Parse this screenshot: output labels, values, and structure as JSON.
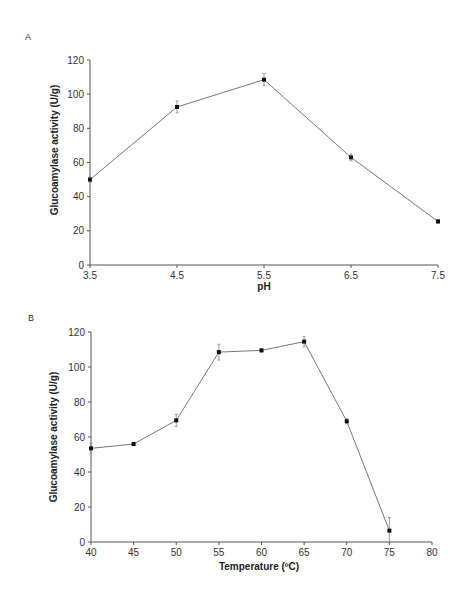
{
  "chart_data": [
    {
      "panel": "A",
      "type": "line",
      "title": "",
      "xlabel": "pH",
      "ylabel": "Glucoamylase activity (U/g)",
      "x": [
        3.5,
        4.5,
        5.5,
        6.5,
        7.5
      ],
      "x_tick_labels": [
        "3.5",
        "4.5",
        "5.5",
        "6.5",
        "7.5"
      ],
      "y_tick_labels": [
        "0",
        "20",
        "40",
        "60",
        "80",
        "100",
        "120"
      ],
      "xlim": [
        3.5,
        7.5
      ],
      "ylim": [
        0,
        120
      ],
      "grid": false,
      "legend": null,
      "series": [
        {
          "name": "Glucoamylase activity",
          "values": [
            50,
            92.5,
            108.5,
            63,
            25.5
          ],
          "error": [
            1.5,
            3.5,
            3.5,
            2,
            1
          ]
        }
      ]
    },
    {
      "panel": "B",
      "type": "line",
      "title": "",
      "xlabel": "Temperature (ºC)",
      "ylabel": "Glucoamylase activity (U/g)",
      "x": [
        40,
        45,
        50,
        55,
        60,
        65,
        70,
        75
      ],
      "x_tick_labels": [
        "40",
        "45",
        "50",
        "55",
        "60",
        "65",
        "70",
        "75",
        "80"
      ],
      "y_tick_labels": [
        "0",
        "20",
        "40",
        "60",
        "80",
        "100",
        "120"
      ],
      "xlim": [
        40,
        80
      ],
      "ylim": [
        0,
        120
      ],
      "grid": false,
      "legend": null,
      "series": [
        {
          "name": "Glucoamylase activity",
          "values": [
            53.5,
            56,
            69.5,
            108.5,
            109.5,
            114.5,
            69,
            6.5
          ],
          "error": [
            3,
            1,
            3.5,
            4.5,
            1,
            3,
            1.5,
            7.5
          ]
        }
      ]
    }
  ],
  "panels": {
    "a": {
      "label": "A",
      "xlabel": "pH",
      "ylabel": "Glucoamylase activity (U/g)"
    },
    "b": {
      "label": "B",
      "xlabel": "Temperature (ºC)",
      "ylabel": "Glucoamylase activity (U/g)"
    }
  }
}
